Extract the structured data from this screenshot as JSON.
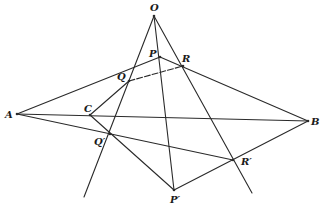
{
  "diagram": {
    "stroke_color": "#2a2a2a",
    "points": [
      {
        "id": "O",
        "label": "O",
        "x": 154,
        "y": 16,
        "lx": 150,
        "ly": 11
      },
      {
        "id": "P",
        "label": "P",
        "x": 160,
        "y": 57,
        "lx": 149,
        "ly": 57
      },
      {
        "id": "R",
        "label": "R",
        "x": 183,
        "y": 66,
        "lx": 182,
        "ly": 62
      },
      {
        "id": "Q",
        "label": "Q",
        "x": 129,
        "y": 81,
        "lx": 117,
        "ly": 80
      },
      {
        "id": "A",
        "label": "A",
        "x": 17,
        "y": 114,
        "lx": 5,
        "ly": 118
      },
      {
        "id": "C",
        "label": "C",
        "x": 90,
        "y": 115,
        "lx": 84,
        "ly": 112
      },
      {
        "id": "B",
        "label": "B",
        "x": 308,
        "y": 121,
        "lx": 311,
        "ly": 125
      },
      {
        "id": "Qp",
        "label": "Q′",
        "x": 110,
        "y": 134,
        "lx": 94,
        "ly": 145
      },
      {
        "id": "Rp",
        "label": "R′",
        "x": 233,
        "y": 160,
        "lx": 241,
        "ly": 165
      },
      {
        "id": "Pp",
        "label": "P′",
        "x": 174,
        "y": 190,
        "lx": 170,
        "ly": 203
      }
    ],
    "lines": [
      {
        "name": "ray-O-Q-Qprime",
        "x1": 154,
        "y1": 16,
        "x2": 84,
        "y2": 197,
        "dashed": false
      },
      {
        "name": "ray-O-P-Pprime",
        "x1": 154,
        "y1": 16,
        "x2": 174,
        "y2": 190,
        "dashed": false
      },
      {
        "name": "ray-O-R-Rprime",
        "x1": 154,
        "y1": 16,
        "x2": 252,
        "y2": 193,
        "dashed": false
      },
      {
        "name": "line-A-Q-P",
        "x1": 17,
        "y1": 114,
        "x2": 160,
        "y2": 57,
        "dashed": false
      },
      {
        "name": "line-P-R-B",
        "x1": 160,
        "y1": 57,
        "x2": 308,
        "y2": 121,
        "dashed": false
      },
      {
        "name": "line-Q-R",
        "x1": 129,
        "y1": 81,
        "x2": 183,
        "y2": 66,
        "dashed": true
      },
      {
        "name": "line-A-C-B",
        "x1": 17,
        "y1": 114,
        "x2": 308,
        "y2": 121,
        "dashed": false
      },
      {
        "name": "line-A-Qprime-Rprime",
        "x1": 17,
        "y1": 114,
        "x2": 233,
        "y2": 160,
        "dashed": false
      },
      {
        "name": "line-C-Q",
        "x1": 90,
        "y1": 115,
        "x2": 129,
        "y2": 81,
        "dashed": false
      },
      {
        "name": "line-C-Qprime-Pprime",
        "x1": 90,
        "y1": 115,
        "x2": 174,
        "y2": 190,
        "dashed": false
      },
      {
        "name": "line-Pprime-Rprime-B",
        "x1": 174,
        "y1": 190,
        "x2": 308,
        "y2": 121,
        "dashed": false
      }
    ]
  }
}
